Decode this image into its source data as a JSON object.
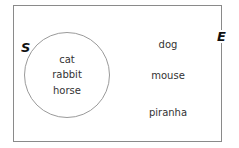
{
  "diagram": {
    "type": "venn",
    "universal_set": {
      "label": "E",
      "elements_outside_S": [
        {
          "label": "dog",
          "x": 168,
          "y": 40
        },
        {
          "label": "mouse",
          "x": 168,
          "y": 71
        },
        {
          "label": "piranha",
          "x": 168,
          "y": 108
        }
      ]
    },
    "set_S": {
      "label": "S",
      "elements": [
        {
          "label": "cat",
          "x": 67,
          "y": 55
        },
        {
          "label": "rabbit",
          "x": 67,
          "y": 70
        },
        {
          "label": "horse",
          "x": 67,
          "y": 86
        }
      ]
    },
    "colors": {
      "border": "#8a8a8a",
      "circle": "#9a9a9a",
      "text": "#333333",
      "label": "#111111"
    }
  }
}
